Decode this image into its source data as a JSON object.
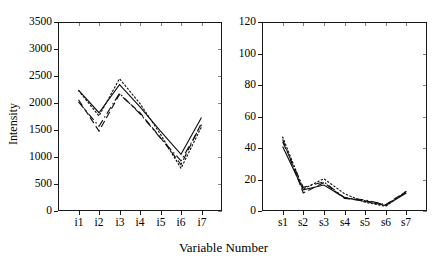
{
  "figure": {
    "xlabel": "Variable Number",
    "ylabel": "Intensity"
  },
  "chart_data": [
    {
      "type": "line",
      "panel": "left",
      "title": "",
      "xlabel": "Variable Number",
      "ylabel": "Intensity",
      "categories": [
        "i1",
        "i2",
        "i3",
        "i4",
        "i5",
        "i6",
        "i7"
      ],
      "xlim": [
        0,
        8
      ],
      "ylim": [
        0,
        3500
      ],
      "yticks": [
        0,
        500,
        1000,
        1500,
        2000,
        2500,
        3000,
        3500
      ],
      "ytick_labels": [
        "0",
        "500",
        "1000",
        "1500",
        "2000",
        "2500",
        "3000",
        "3500"
      ],
      "grid": false,
      "legend": "none",
      "series": [
        {
          "name": "solid",
          "style": "solid",
          "values": [
            2240,
            1820,
            2340,
            1930,
            1480,
            1050,
            1730
          ]
        },
        {
          "name": "dashed",
          "style": "dashed",
          "values": [
            2060,
            1480,
            2160,
            1820,
            1360,
            860,
            1630
          ]
        },
        {
          "name": "dashdot",
          "style": "dashdot",
          "values": [
            2020,
            1570,
            2180,
            1800,
            1350,
            930,
            1600
          ]
        },
        {
          "name": "dotted",
          "style": "dotted",
          "values": [
            2230,
            1760,
            2450,
            1990,
            1420,
            790,
            1560
          ]
        }
      ]
    },
    {
      "type": "line",
      "panel": "right",
      "title": "",
      "xlabel": "Variable Number",
      "ylabel": "Intensity",
      "categories": [
        "s1",
        "s2",
        "s3",
        "s4",
        "s5",
        "s6",
        "s7"
      ],
      "xlim": [
        0,
        8
      ],
      "ylim": [
        0,
        120
      ],
      "yticks": [
        0,
        20,
        40,
        60,
        80,
        100,
        120
      ],
      "ytick_labels": [
        "0",
        "20",
        "40",
        "60",
        "80",
        "100",
        "120"
      ],
      "grid": false,
      "legend": "none",
      "series": [
        {
          "name": "solid",
          "style": "solid",
          "values": [
            41.0,
            13.5,
            16.5,
            8.5,
            6.0,
            3.5,
            11.5
          ]
        },
        {
          "name": "dashed",
          "style": "dashed",
          "values": [
            45.5,
            11.5,
            18.0,
            8.0,
            6.5,
            4.0,
            12.5
          ]
        },
        {
          "name": "dashdot",
          "style": "dashdot",
          "values": [
            44.0,
            15.0,
            18.5,
            8.5,
            7.0,
            4.0,
            12.0
          ]
        },
        {
          "name": "dotted",
          "style": "dotted",
          "values": [
            47.0,
            14.0,
            20.5,
            11.0,
            5.5,
            3.0,
            12.5
          ]
        }
      ]
    }
  ]
}
